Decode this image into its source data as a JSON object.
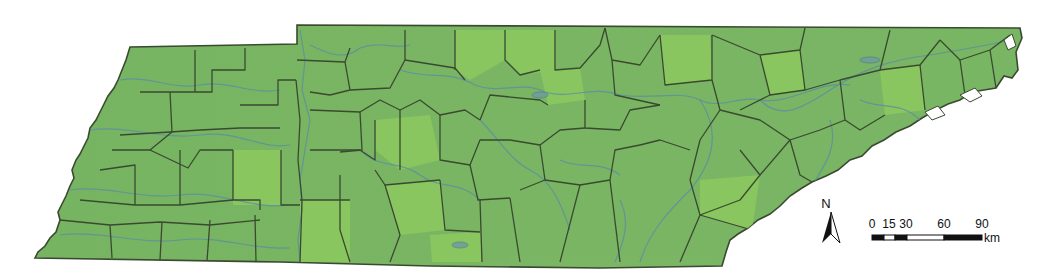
{
  "map": {
    "subject": "Tennessee county map",
    "colors": {
      "land": "#79b563",
      "land_light": "#8cc95e",
      "county_border": "#3a4a30",
      "river": "#5d8fa0",
      "background": "#ffffff"
    },
    "north_arrow": {
      "label": "N"
    },
    "scale_bar": {
      "ticks": [
        "0",
        "15",
        "30",
        "60",
        "90"
      ],
      "unit": "km"
    }
  }
}
